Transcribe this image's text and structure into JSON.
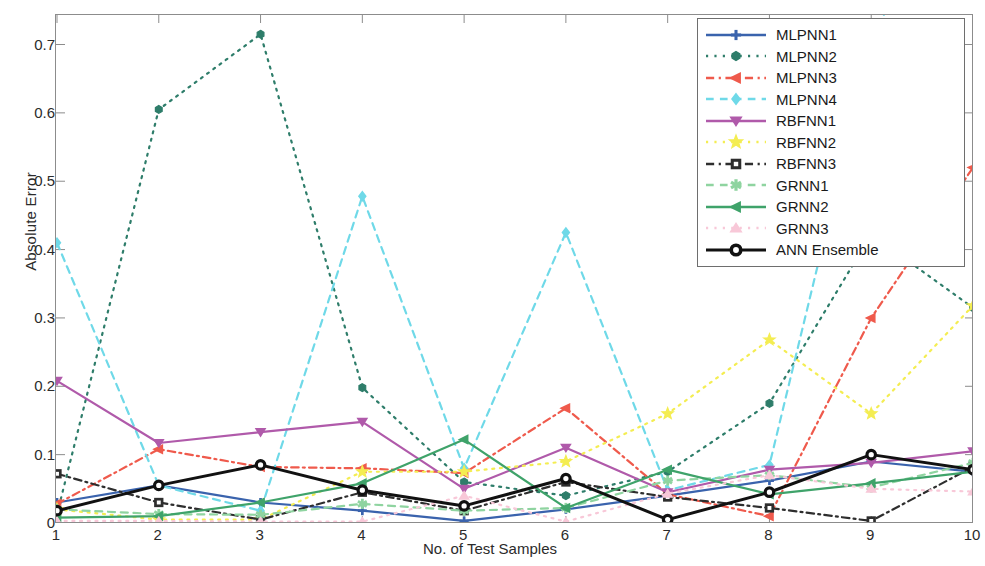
{
  "chart_data": {
    "type": "line",
    "title": "",
    "xlabel": "No. of Test Samples",
    "ylabel": "Absolute Error",
    "x": [
      1,
      2,
      3,
      4,
      5,
      6,
      7,
      8,
      9,
      10
    ],
    "xlim": [
      1,
      10
    ],
    "ylim": [
      0,
      0.73
    ],
    "xticks": [
      "1",
      "2",
      "3",
      "4",
      "5",
      "6",
      "7",
      "8",
      "9",
      "10"
    ],
    "yticks": [
      "0",
      "0.1",
      "0.2",
      "0.3",
      "0.4",
      "0.5",
      "0.6",
      "0.7"
    ],
    "grid": false,
    "legend_position": "top-right",
    "series": [
      {
        "name": "MLPNN1",
        "color": "#3a63ad",
        "style": "solid",
        "marker": "plus",
        "values": [
          0.03,
          0.055,
          0.03,
          0.018,
          0.003,
          0.02,
          0.04,
          0.062,
          0.09,
          0.075
        ]
      },
      {
        "name": "MLPNN2",
        "color": "#2e7d6a",
        "style": "dotted",
        "marker": "hexagon",
        "values": [
          0.013,
          0.605,
          0.715,
          0.198,
          0.06,
          0.04,
          0.075,
          0.175,
          0.422,
          0.315
        ]
      },
      {
        "name": "MLPNN3",
        "color": "#ef5a4c",
        "style": "dashdot",
        "marker": "leftarrow",
        "values": [
          0.028,
          0.108,
          0.082,
          0.08,
          0.073,
          0.168,
          0.042,
          0.01,
          0.3,
          0.52
        ]
      },
      {
        "name": "MLPNN4",
        "color": "#6fd9e8",
        "style": "dashed",
        "marker": "diamond",
        "values": [
          0.41,
          0.055,
          0.018,
          0.478,
          0.08,
          0.425,
          0.048,
          0.085,
          0.7,
          1.05
        ]
      },
      {
        "name": "RBFNN1",
        "color": "#b05aaa",
        "style": "solid",
        "marker": "triangledown",
        "values": [
          0.208,
          0.117,
          0.133,
          0.148,
          0.05,
          0.11,
          0.045,
          0.078,
          0.088,
          0.105
        ]
      },
      {
        "name": "RBFNN2",
        "color": "#f4ed52",
        "style": "dotted",
        "marker": "star",
        "values": [
          0.02,
          0.005,
          0.005,
          0.075,
          0.075,
          0.09,
          0.16,
          0.268,
          0.16,
          0.318
        ]
      },
      {
        "name": "RBFNN3",
        "color": "#2e2e2e",
        "style": "dashdot",
        "marker": "square",
        "values": [
          0.072,
          0.03,
          0.005,
          0.045,
          0.018,
          0.06,
          0.038,
          0.022,
          0.003,
          0.082
        ]
      },
      {
        "name": "GRNN1",
        "color": "#8fd4a0",
        "style": "dashed",
        "marker": "asterisk",
        "values": [
          0.02,
          0.013,
          0.012,
          0.028,
          0.018,
          0.022,
          0.062,
          0.07,
          0.052,
          0.088
        ]
      },
      {
        "name": "GRNN2",
        "color": "#3fa36a",
        "style": "solid",
        "marker": "leftarrow",
        "values": [
          0.008,
          0.01,
          0.03,
          0.058,
          0.122,
          0.022,
          0.078,
          0.042,
          0.058,
          0.075
        ]
      },
      {
        "name": "GRNN3",
        "color": "#f8c8d8",
        "style": "dotted",
        "marker": "triangleup",
        "values": [
          0.003,
          0.003,
          0.002,
          0.002,
          0.04,
          0.002,
          0.043,
          0.07,
          0.05,
          0.046
        ]
      },
      {
        "name": "ANN Ensemble",
        "color": "#111111",
        "style": "solid",
        "marker": "circle",
        "values": [
          0.018,
          0.055,
          0.085,
          0.048,
          0.025,
          0.065,
          0.005,
          0.045,
          0.1,
          0.078
        ]
      }
    ]
  },
  "axes": {
    "ylabel": "Absolute Error",
    "xlabel": "No. of Test Samples"
  }
}
